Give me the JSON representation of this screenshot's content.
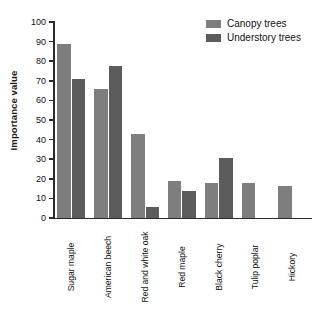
{
  "chart_data": {
    "type": "bar",
    "title": "",
    "xlabel": "",
    "ylabel": "Importance value",
    "ylim": [
      0,
      100
    ],
    "ytick_step": 10,
    "yticks": [
      100,
      90,
      80,
      70,
      60,
      50,
      40,
      30,
      20,
      10,
      0
    ],
    "grid": false,
    "legend_position": "top-right",
    "categories": [
      "Sugar maple",
      "American beech",
      "Red and white oak",
      "Red maple",
      "Black cherry",
      "Tulip poplar",
      "Hickory"
    ],
    "series": [
      {
        "name": "Canopy trees",
        "color": "#7e7e7e",
        "values": [
          89,
          66,
          43,
          19,
          18,
          18,
          16.5
        ]
      },
      {
        "name": "Understory trees",
        "color": "#5c5c5c",
        "values": [
          71,
          77.5,
          5.5,
          14,
          30.5,
          0,
          0
        ]
      }
    ]
  },
  "colors": {
    "axis": "#2b2b2b",
    "text": "#111111",
    "background": "#ffffff",
    "canopy": "#7e7e7e",
    "understory": "#5c5c5c"
  }
}
